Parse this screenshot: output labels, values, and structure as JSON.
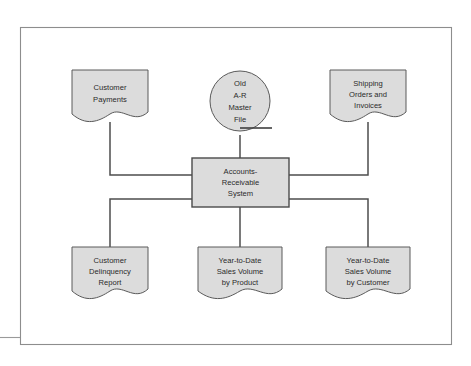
{
  "figure": {
    "frame": {
      "x": 20,
      "y": 27,
      "width": 432,
      "height": 318
    },
    "colors": {
      "shape_fill": "#dcdcdc",
      "shape_stroke": "#5a5a5a",
      "process_stroke": "#4a4a4a",
      "connector": "#4e4e4e",
      "frame": "#8d8d8d",
      "text": "#2b2b2b",
      "background": "#ffffff"
    },
    "inputs": [
      {
        "id": "customer-payments",
        "shape": "document",
        "lines": [
          "Customer",
          "Payments"
        ]
      },
      {
        "id": "old-ar-master-file",
        "shape": "magnetic-tape",
        "lines": [
          "Old",
          "A-R",
          "Master",
          "File"
        ]
      },
      {
        "id": "shipping-orders-and-invoices",
        "shape": "document",
        "lines": [
          "Shipping",
          "Orders and",
          "Invoices"
        ]
      }
    ],
    "process": {
      "id": "accounts-receivable-system",
      "shape": "process",
      "lines": [
        "Accounts-",
        "Receivable",
        "System"
      ]
    },
    "outputs": [
      {
        "id": "customer-delinquency-report",
        "shape": "document",
        "lines": [
          "Customer",
          "Delinquency",
          "Report"
        ]
      },
      {
        "id": "year-to-date-sales-volume-by-product",
        "shape": "document",
        "lines": [
          "Year-to-Date",
          "Sales Volume",
          "by Product"
        ]
      },
      {
        "id": "year-to-date-sales-volume-by-customer",
        "shape": "document",
        "lines": [
          "Year-to-Date",
          "Sales Volume",
          "by Customer"
        ]
      }
    ]
  }
}
